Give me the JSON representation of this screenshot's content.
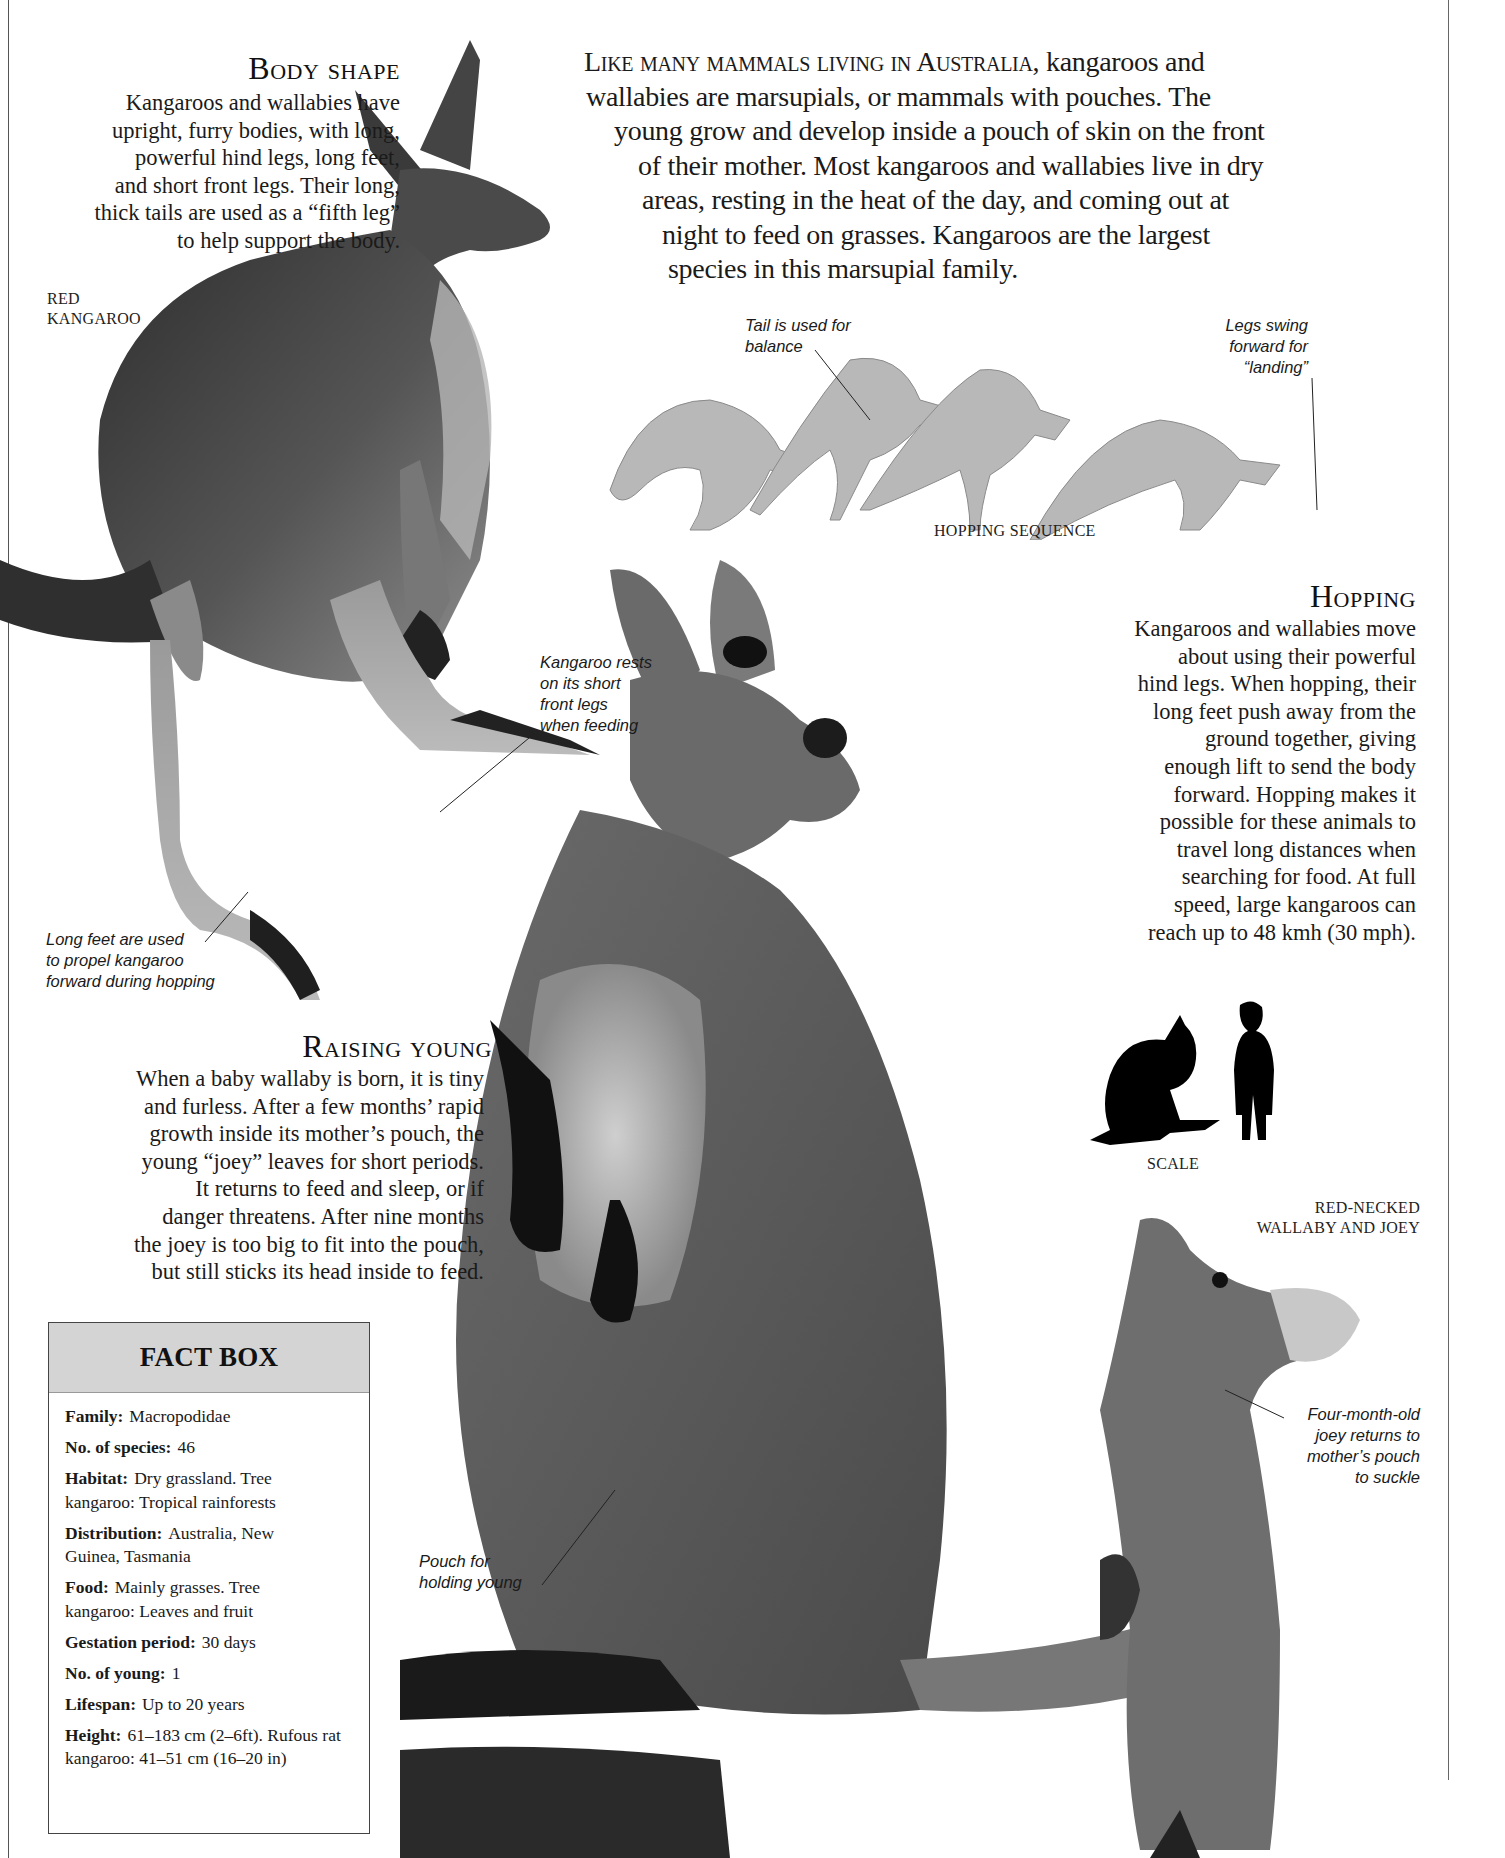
{
  "intro": {
    "lead": "Like many mammals living in Australia,",
    "lines": [
      " kangaroos and",
      "wallabies are marsupials, or mammals with pouches. The",
      "young grow and develop inside a pouch of skin on the front",
      "of their mother. Most kangaroos and wallabies live in dry",
      "areas, resting in the heat of the day, and coming out at",
      "night to feed on grasses. Kangaroos are the largest",
      "species in this marsupial family."
    ]
  },
  "body_shape": {
    "heading": "Body shape",
    "lines": [
      "Kangaroos and wallabies have",
      "upright, furry bodies, with long,",
      "powerful hind legs, long feet,",
      "and short front legs. Their long,",
      "thick tails are used as a “fifth leg”",
      "to help support the body."
    ]
  },
  "red_kangaroo_label": [
    "RED",
    "KANGAROO"
  ],
  "hopping_sequence": {
    "label": "HOPPING SEQUENCE",
    "annotation_tail": [
      "Tail is used for",
      "balance"
    ],
    "annotation_legs": [
      "Legs swing",
      "forward for",
      "“landing”"
    ]
  },
  "hopping": {
    "heading": "Hopping",
    "lines": [
      "Kangaroos and wallabies move",
      "about using their powerful",
      "hind legs. When hopping, their",
      "long feet push away from the",
      "ground together, giving",
      "enough lift to send the body",
      "forward. Hopping makes it",
      "possible for these animals to",
      "travel long distances when",
      "searching for food. At full",
      "speed, large kangaroos can",
      "reach up to 48 kmh (30 mph)."
    ]
  },
  "annotations": {
    "front_legs": [
      "Kangaroo rests",
      "on its short",
      "front legs",
      "when feeding"
    ],
    "long_feet": [
      "Long feet are used",
      "to propel kangaroo",
      "forward during hopping"
    ],
    "pouch": [
      "Pouch for",
      "holding young"
    ],
    "joey": [
      "Four-month-old",
      "joey returns to",
      "mother’s pouch",
      "to suckle"
    ]
  },
  "scale": {
    "label": "SCALE"
  },
  "wallaby_label": [
    "RED-NECKED",
    "WALLABY AND JOEY"
  ],
  "raising_young": {
    "heading": "Raising young",
    "lines": [
      "When a baby wallaby is born, it is tiny",
      "and furless. After a few months’ rapid",
      "growth inside its mother’s pouch, the",
      "young “joey” leaves for short periods.",
      "It returns to feed and sleep, or if",
      "danger threatens. After nine months",
      "the joey is too big to fit into the pouch,",
      "but still sticks its head inside to feed."
    ]
  },
  "fact_box": {
    "title": "FACT BOX",
    "items": [
      {
        "key": "Family:",
        "value": "Macropodidae"
      },
      {
        "key": "No. of species:",
        "value": "46"
      },
      {
        "key": "Habitat:",
        "value": "Dry grassland. Tree kangaroo: Tropical rainforests"
      },
      {
        "key": "Distribution:",
        "value": "Australia, New Guinea, Tasmania"
      },
      {
        "key": "Food:",
        "value": "Mainly grasses. Tree kangaroo: Leaves and fruit"
      },
      {
        "key": "Gestation period:",
        "value": "30 days"
      },
      {
        "key": "No. of young:",
        "value": "1"
      },
      {
        "key": "Lifespan:",
        "value": "Up to 20 years"
      },
      {
        "key": "Height:",
        "value": "61–183 cm (2–6ft). Rufous rat kangaroo: 41–51 cm (16–20 in)"
      }
    ]
  },
  "colors": {
    "text": "#1a1a1a",
    "fact_header_bg": "#d4d4d4",
    "fur_dark": "#3a3a3a",
    "fur_mid": "#7a7a7a",
    "fur_light": "#bdbdbd"
  }
}
